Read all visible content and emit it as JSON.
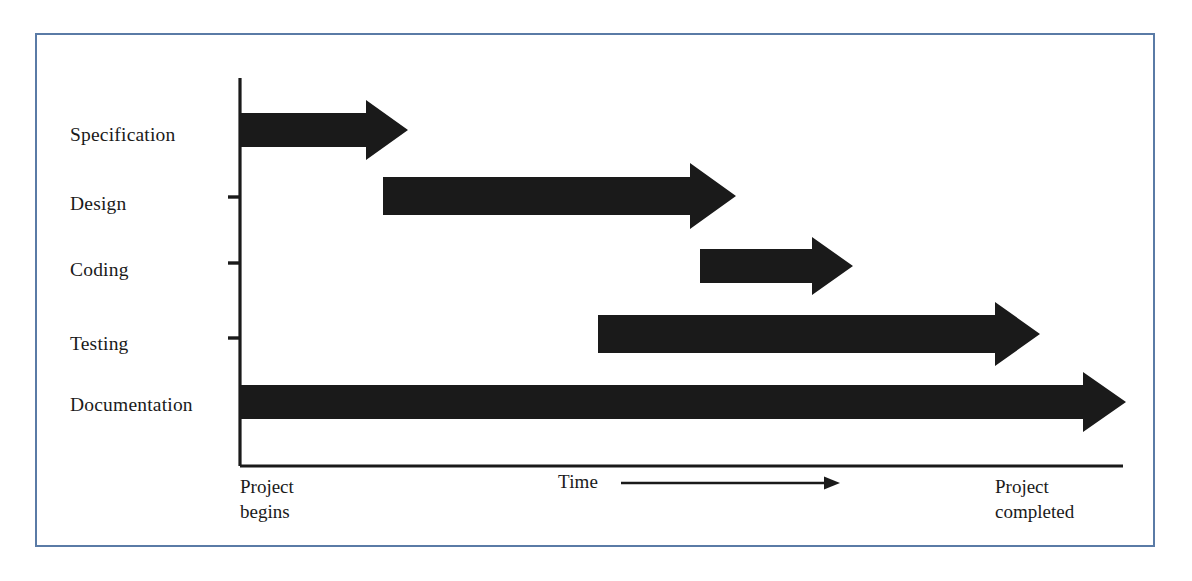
{
  "figure": {
    "kind": "software-lifecycle-gantt-chart",
    "border_color": "#5a7ba6",
    "background_color": "#ffffff",
    "ink_color": "#1a1a1a"
  },
  "axes": {
    "y_axis_label": "",
    "x_axis_label": "Time",
    "x_start_label_line1": "Project",
    "x_start_label_line2": "begins",
    "x_end_label_line1": "Project",
    "x_end_label_line2": "completed",
    "tick_rows": [
      "Design",
      "Coding",
      "Testing"
    ]
  },
  "chart_data": {
    "type": "bar",
    "title": "",
    "subtitle": "",
    "xlabel": "Time",
    "ylabel": "",
    "grid": false,
    "legend": null,
    "orientation": "horizontal",
    "xlim": [
      0,
      100
    ],
    "x_tick_labels": [
      "Project begins",
      "Project completed"
    ],
    "categories": [
      "Specification",
      "Design",
      "Coding",
      "Testing",
      "Documentation"
    ],
    "series": [
      {
        "name": "Phase duration",
        "bars": [
          {
            "category": "Specification",
            "start": 0,
            "end": 19
          },
          {
            "category": "Design",
            "start": 16,
            "end": 56
          },
          {
            "category": "Coding",
            "start": 52,
            "end": 69
          },
          {
            "category": "Testing",
            "start": 41,
            "end": 90
          },
          {
            "category": "Documentation",
            "start": 0,
            "end": 100
          }
        ]
      }
    ]
  },
  "rows": [
    {
      "label": "Specification",
      "label_x": 70,
      "label_baseline_y": 142,
      "bar": {
        "x1": 240,
        "x2": 408,
        "cy": 130,
        "shaft_half": 17,
        "head_half": 30,
        "head_len": 42
      },
      "tick": false
    },
    {
      "label": "Design",
      "label_x": 70,
      "label_baseline_y": 211,
      "bar": {
        "x1": 383,
        "x2": 736,
        "cy": 196,
        "shaft_half": 19,
        "head_half": 33,
        "head_len": 46
      },
      "tick": true,
      "tick_y": 197
    },
    {
      "label": "Coding",
      "label_x": 70,
      "label_baseline_y": 277,
      "bar": {
        "x1": 700,
        "x2": 853,
        "cy": 266,
        "shaft_half": 17,
        "head_half": 29,
        "head_len": 41
      },
      "tick": true,
      "tick_y": 263
    },
    {
      "label": "Testing",
      "label_x": 70,
      "label_baseline_y": 351,
      "bar": {
        "x1": 598,
        "x2": 1040,
        "cy": 334,
        "shaft_half": 19,
        "head_half": 32,
        "head_len": 45
      },
      "tick": true,
      "tick_y": 338
    },
    {
      "label": "Documentation",
      "label_x": 70,
      "label_baseline_y": 412,
      "bar": {
        "x1": 240,
        "x2": 1126,
        "cy": 402,
        "shaft_half": 17,
        "head_half": 30,
        "head_len": 43
      },
      "tick": false
    }
  ],
  "geometry": {
    "y_axis_x": 240,
    "y_axis_top": 78,
    "y_axis_bottom": 466,
    "x_axis_y": 466,
    "x_axis_x1": 240,
    "x_axis_x2": 1123,
    "tick_length": 12,
    "time_text_x": 558,
    "time_text_baseline_y": 489,
    "time_arrow_x1": 621,
    "time_arrow_x2": 840,
    "time_arrow_y": 483,
    "start_note_x": 240,
    "start_note_y": 474,
    "end_note_x": 995,
    "end_note_y": 474
  }
}
